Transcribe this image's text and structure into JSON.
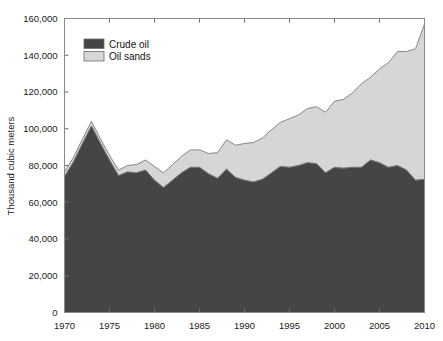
{
  "chart_data": {
    "type": "area",
    "stacked": true,
    "title": "",
    "xlabel": "",
    "ylabel": "Thousand cubic meters",
    "xlim": [
      1970,
      2010
    ],
    "ylim": [
      0,
      160000
    ],
    "ytick_labels": [
      "0",
      "20,000",
      "40,000",
      "60,000",
      "80,000",
      "100,000",
      "120,000",
      "140,000",
      "160,000"
    ],
    "ytick_values": [
      0,
      20000,
      40000,
      60000,
      80000,
      100000,
      120000,
      140000,
      160000
    ],
    "xtick_labels": [
      "1970",
      "1975",
      "1980",
      "1985",
      "1990",
      "1995",
      "2000",
      "2005",
      "2010"
    ],
    "xtick_values": [
      1970,
      1975,
      1980,
      1985,
      1990,
      1995,
      2000,
      2005,
      2010
    ],
    "grid": false,
    "legend_position": "upper-left",
    "colors": {
      "crude_oil": "#454545",
      "oil_sands": "#d6d6d6",
      "edge": "#7a7a7a",
      "frame": "#8a8a8a",
      "text": "#1a1a1a",
      "background": "#ffffff"
    },
    "x": [
      1970,
      1971,
      1972,
      1973,
      1974,
      1975,
      1976,
      1977,
      1978,
      1979,
      1980,
      1981,
      1982,
      1983,
      1984,
      1985,
      1986,
      1987,
      1988,
      1989,
      1990,
      1991,
      1992,
      1993,
      1994,
      1995,
      1996,
      1997,
      1998,
      1999,
      2000,
      2001,
      2002,
      2003,
      2004,
      2005,
      2006,
      2007,
      2008,
      2009,
      2010
    ],
    "series": [
      {
        "name": "Crude oil",
        "color": "#454545",
        "values": [
          74000,
          82000,
          92000,
          101500,
          92000,
          83000,
          74500,
          76500,
          76000,
          77500,
          72000,
          68000,
          72000,
          76000,
          79000,
          79000,
          75500,
          73000,
          78000,
          73500,
          72000,
          71000,
          72500,
          76000,
          79500,
          79000,
          80000,
          81500,
          81000,
          76000,
          79000,
          78500,
          79000,
          79000,
          83000,
          81500,
          79000,
          80000,
          77500,
          72000,
          72500
        ]
      },
      {
        "name": "Oil sands",
        "color": "#d6d6d6",
        "values": [
          2500,
          2500,
          2500,
          2500,
          2500,
          2500,
          3000,
          3500,
          4500,
          5500,
          7500,
          8000,
          8500,
          9000,
          9500,
          9500,
          11000,
          14000,
          16000,
          17500,
          20000,
          21500,
          22500,
          23500,
          24000,
          26500,
          27500,
          29500,
          31000,
          33000,
          36000,
          37500,
          40500,
          45500,
          45000,
          51000,
          57000,
          62000,
          64500,
          71500,
          84500
        ]
      }
    ],
    "totals": [
      76500,
      84500,
      94500,
      104000,
      94500,
      85500,
      77500,
      80000,
      80500,
      83000,
      79500,
      76000,
      80500,
      85000,
      88500,
      88500,
      86500,
      87000,
      94000,
      91000,
      92000,
      92500,
      95000,
      99500,
      103500,
      105500,
      107500,
      111000,
      112000,
      109000,
      115000,
      116000,
      119500,
      124500,
      128000,
      132500,
      136000,
      142000,
      142000,
      143500,
      157000
    ]
  },
  "legend": {
    "items": [
      {
        "label": "Crude oil",
        "swatch": "#454545"
      },
      {
        "label": "Oil sands",
        "swatch": "#d6d6d6"
      }
    ]
  },
  "axes": {
    "y_title": "Thousand cubic meters"
  }
}
